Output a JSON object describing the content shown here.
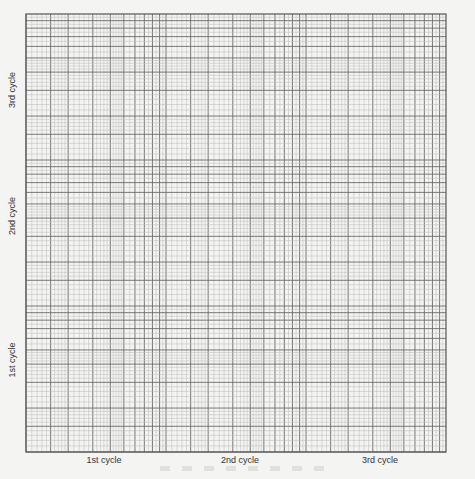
{
  "paper": {
    "type": "log-log graph paper",
    "x_cycles": 3,
    "y_cycles": 3,
    "bounds": {
      "left": 26,
      "top": 14,
      "right": 446,
      "bottom": 452
    },
    "colors": {
      "background": "#f4f4f2",
      "minor": "#b8b8b8",
      "major": "#6a6a6a",
      "border": "#555555",
      "label": "#333333"
    }
  },
  "x_axis": {
    "labels": [
      {
        "text": "1st cycle",
        "x": 104
      },
      {
        "text": "2nd cycle",
        "x": 240
      },
      {
        "text": "3rd cycle",
        "x": 380
      }
    ]
  },
  "y_axis": {
    "labels": [
      {
        "text": "3rd cycle",
        "y": 90
      },
      {
        "text": "2nd cycle",
        "y": 216
      },
      {
        "text": "1st cycle",
        "y": 360
      }
    ]
  }
}
